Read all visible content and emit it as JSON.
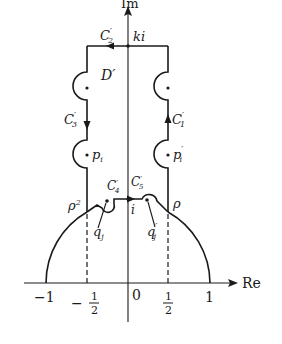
{
  "diagram": {
    "axes": {
      "imag_label": "Im",
      "real_label": "Re"
    },
    "ticks": {
      "neg_one": "−1",
      "neg_half_sign": "−",
      "half_num": "1",
      "half_den": "2",
      "zero": "0",
      "one": "1"
    },
    "labels": {
      "c1": "C",
      "c1_sub": "1",
      "c2": "C",
      "c2_sub": "2",
      "c3": "C",
      "c3_sub": "3",
      "c4": "C",
      "c4_sub": "4",
      "c5": "C",
      "c5_sub": "5",
      "prime": "′",
      "ki": "ki",
      "region": "D′",
      "p_left": "p",
      "p_sub": "i",
      "p_right": "p",
      "rho2": "ρ",
      "rho2_sup": "2",
      "rho": "ρ",
      "i": "i",
      "q_left": "q",
      "q_sub": "j",
      "q_right": "q"
    },
    "colors": {
      "ink": "#1a1a1a",
      "background": "#ffffff"
    }
  }
}
